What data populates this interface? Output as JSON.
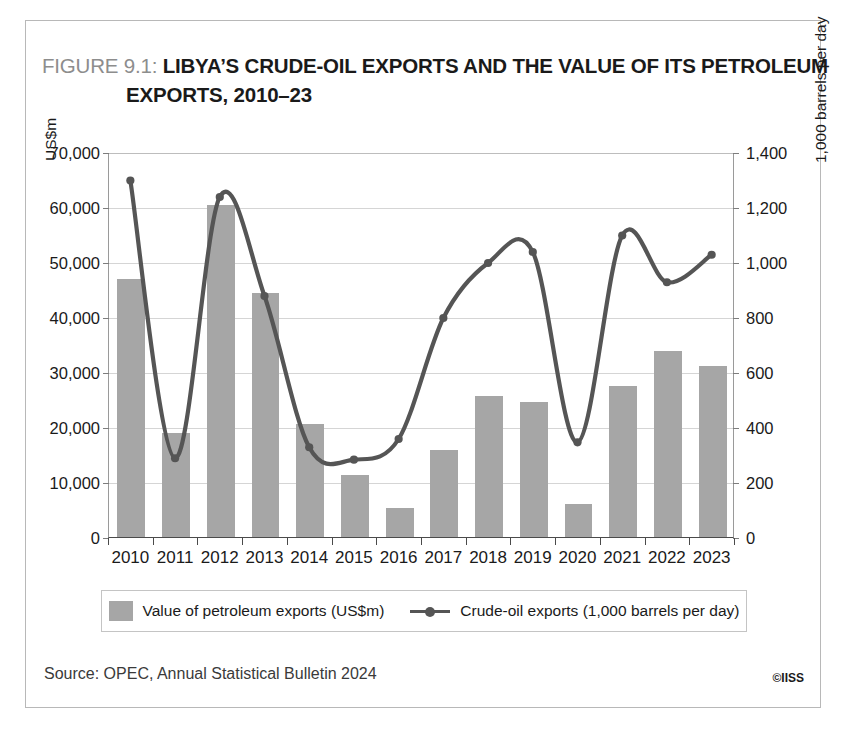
{
  "figure": {
    "number_label": "FIGURE 9.1:",
    "title_line1": "LIBYA’S CRUDE-OIL EXPORTS AND THE VALUE OF ITS PETROLEUM",
    "title_line2": "EXPORTS, 2010–23"
  },
  "source": {
    "text": "Source: OPEC, Annual Statistical Bulletin 2024",
    "copyright": "©IISS"
  },
  "legend": {
    "bar_label": "Value of petroleum exports (US$m)",
    "line_label": "Crude-oil exports (1,000 barrels per day)"
  },
  "colors": {
    "bar": "#a6a6a6",
    "line": "#555555",
    "grid": "#d5d5d5",
    "frame": "#b8b8b8",
    "axis": "#4a4a4a",
    "title_grey": "#8d8d8d",
    "title_black": "#1a1a1a"
  },
  "chart_data": {
    "type": "bar",
    "title": "LIBYA’S CRUDE-OIL EXPORTS AND THE VALUE OF ITS PETROLEUM EXPORTS, 2010–23",
    "xlabel": "",
    "categories": [
      "2010",
      "2011",
      "2012",
      "2013",
      "2014",
      "2015",
      "2016",
      "2017",
      "2018",
      "2019",
      "2020",
      "2021",
      "2022",
      "2023"
    ],
    "grid": true,
    "legend_position": "bottom",
    "series": [
      {
        "name": "Value of petroleum exports (US$m)",
        "type": "bar",
        "axis": "left",
        "unit": "US$m",
        "color": "#a6a6a6",
        "values": [
          47000,
          18900,
          60400,
          44300,
          20500,
          11200,
          5200,
          15800,
          25600,
          24500,
          6000,
          27500,
          33800,
          31100
        ]
      },
      {
        "name": "Crude-oil exports (1,000 barrels per day)",
        "type": "line",
        "axis": "right",
        "unit": "1,000 barrels per day",
        "color": "#555555",
        "values": [
          1300,
          290,
          1240,
          880,
          330,
          285,
          360,
          800,
          1000,
          1040,
          348,
          1100,
          930,
          1030
        ]
      }
    ],
    "axes": {
      "left": {
        "label": "US$m",
        "min": 0,
        "max": 70000,
        "step": 10000,
        "ticks": [
          "0",
          "10,000",
          "20,000",
          "30,000",
          "40,000",
          "50,000",
          "60,000",
          "70,000"
        ]
      },
      "right": {
        "label": "1,000 barrels per day",
        "min": 0,
        "max": 1400,
        "step": 200,
        "ticks": [
          "0",
          "200",
          "400",
          "600",
          "800",
          "1,000",
          "1,200",
          "1,400"
        ]
      }
    }
  }
}
